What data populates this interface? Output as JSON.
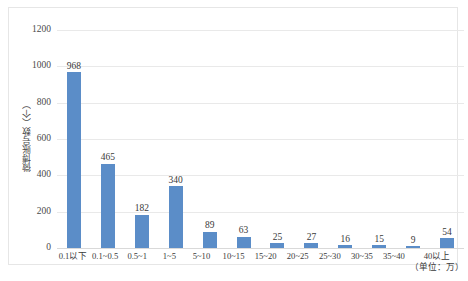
{
  "chart_data": {
    "type": "bar",
    "title": "",
    "xlabel": "（单位：万）",
    "ylabel": "微博账号数（个）",
    "ylim": [
      0,
      1200
    ],
    "yticks": [
      0,
      200,
      400,
      600,
      800,
      1000,
      1200
    ],
    "ytick_labels": [
      "0",
      "200",
      "400",
      "600",
      "800",
      "1000",
      "1200"
    ],
    "grid": true,
    "legend": "none",
    "bar_color": "#5b8dc8",
    "categories": [
      "0.1以下",
      "0.1~0.5",
      "0.5~1",
      "1~5",
      "5~10",
      "10~15",
      "15~20",
      "20~25",
      "25~30",
      "30~35",
      "35~40",
      "40以上"
    ],
    "values": [
      968,
      465,
      182,
      340,
      89,
      63,
      25,
      27,
      16,
      15,
      9,
      54
    ],
    "data_labels": [
      "968",
      "465",
      "182",
      "340",
      "89",
      "63",
      "25",
      "27",
      "16",
      "15",
      "9",
      "54"
    ],
    "unit_note": "（单位：万）"
  }
}
